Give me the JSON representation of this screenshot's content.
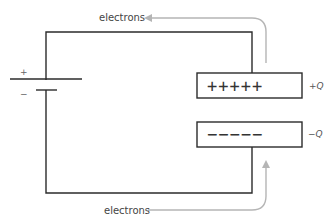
{
  "diagram": {
    "type": "circuit",
    "battery": {
      "positive_sign": "+",
      "negative_sign": "−"
    },
    "capacitor": {
      "top_plate": {
        "symbols": "+++++",
        "charge_label": "+Q"
      },
      "bottom_plate": {
        "symbols": "−−−−−",
        "charge_label": "−Q"
      }
    },
    "flows": {
      "top": {
        "label": "electrons",
        "direction": "left"
      },
      "bottom": {
        "label": "electrons",
        "direction": "up-into-bottom-plate"
      }
    },
    "colors": {
      "wire": "#2b2b2b",
      "flow_arrow": "#b5b5b5"
    }
  }
}
